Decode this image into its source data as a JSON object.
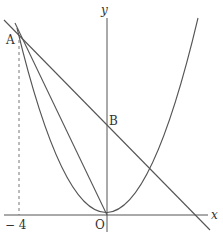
{
  "figure": {
    "type": "coordinate-geometry",
    "axes": {
      "x_label": "x",
      "y_label": "y",
      "origin_label": "O"
    },
    "points": [
      {
        "name": "A",
        "label": "A",
        "x": -4
      },
      {
        "name": "B",
        "label": "B",
        "note": "intersection of line with y-axis"
      },
      {
        "name": "O",
        "label": "O",
        "x": 0,
        "y": 0
      }
    ],
    "tick_labels": [
      {
        "value": "− 4",
        "axis": "x"
      }
    ],
    "elements": [
      {
        "kind": "parabola",
        "description": "y = ax^2 through O and A"
      },
      {
        "kind": "line",
        "description": "line through A and B, crossing x-axis at positive x"
      },
      {
        "kind": "segment",
        "description": "segment AO"
      },
      {
        "kind": "dashed",
        "description": "vertical dashed line from A to x = -4"
      }
    ],
    "colors": {
      "stroke": "#555555",
      "background": "#ffffff"
    }
  }
}
